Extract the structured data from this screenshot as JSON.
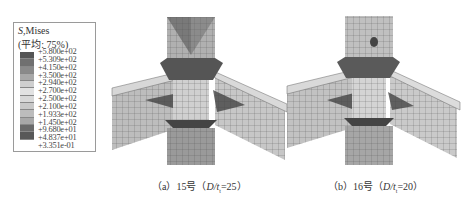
{
  "legend": {
    "title_var": "S",
    "title_rest": ",Mises",
    "subtitle": "(平均: 75%)",
    "values": [
      "+5.800e+02",
      "+5.309e+02",
      "+4.150e+02",
      "+3.500e+02",
      "+2.940e+02",
      "+2.700e+02",
      "+2.500e+02",
      "+2.100e+02",
      "+1.933e+02",
      "+1.450e+02",
      "+9.680e+01",
      "+4.837e+01",
      "+3.351e-01"
    ],
    "colors": [
      "#555555",
      "#707070",
      "#8a8a8a",
      "#a8a8a8",
      "#cfcfcf",
      "#e2e2e2",
      "#d8d8d8",
      "#c8c8c8",
      "#bcbcbc",
      "#a8a8a8",
      "#6a6a6a",
      "#585858"
    ]
  },
  "panels": [
    {
      "caption_prefix": "（a）15号（",
      "caption_var": "D/t",
      "caption_sub": "t",
      "caption_suffix": "=25）"
    },
    {
      "caption_prefix": "（b）16号（",
      "caption_var": "D/t",
      "caption_sub": "t",
      "caption_suffix": "=20）"
    }
  ]
}
